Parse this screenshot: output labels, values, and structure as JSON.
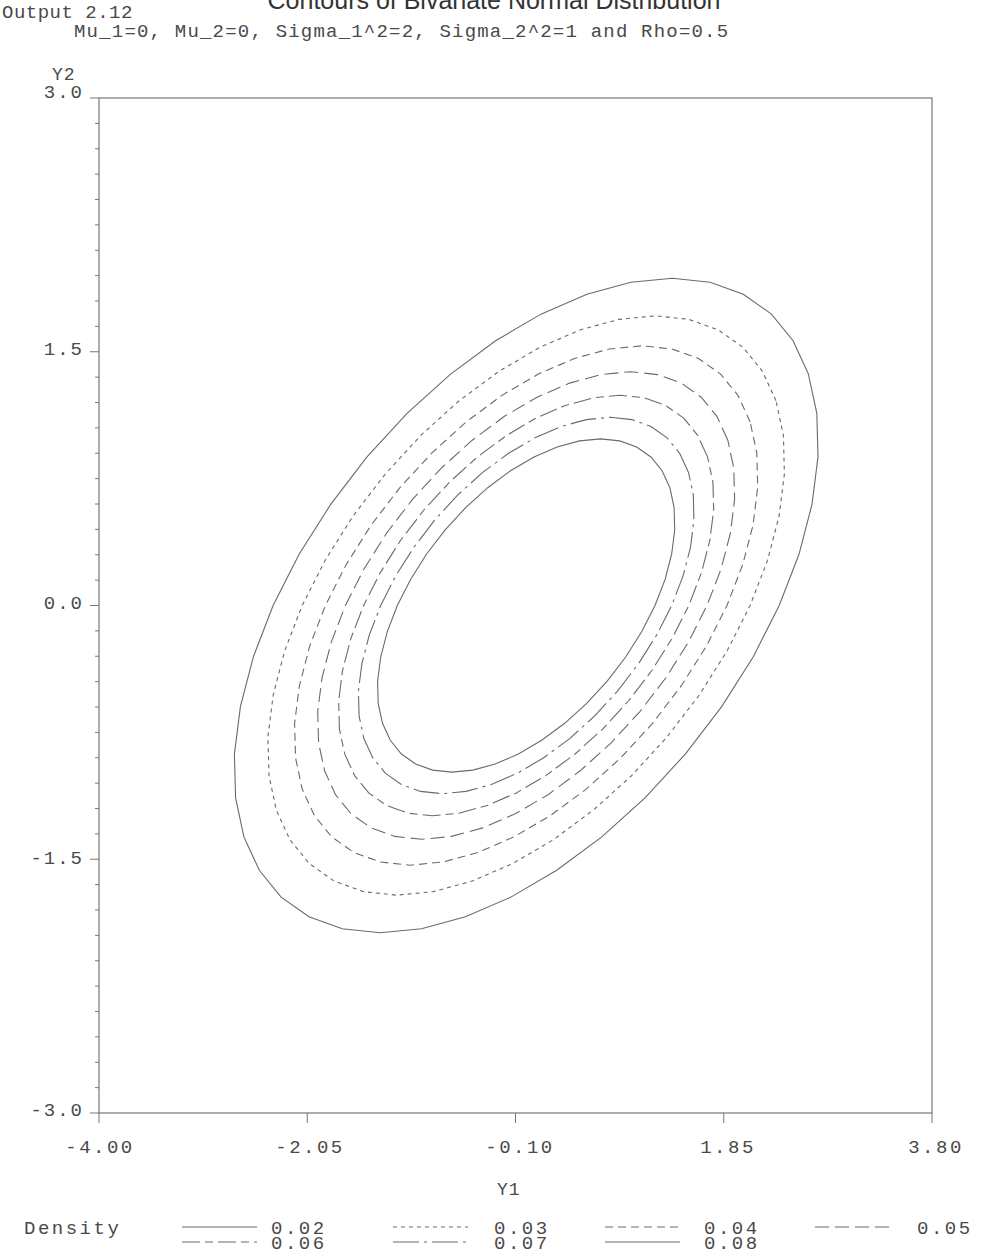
{
  "header": {
    "title": "Contours of Bivariate Normal Distribution",
    "output_label": "Output 2.12",
    "subtitle": "Mu_1=0, Mu_2=0, Sigma_1^2=2, Sigma_2^2=1 and Rho=0.5"
  },
  "axes": {
    "y_label": "Y2",
    "x_label": "Y1",
    "y_ticks": [
      "3.0",
      "1.5",
      "0.0",
      "-1.5",
      "-3.0"
    ],
    "x_ticks": [
      "-4.00",
      "-2.05",
      "-0.10",
      "1.85",
      "3.80"
    ]
  },
  "legend": {
    "title": "Density",
    "entries": [
      {
        "label": "0.02",
        "style": "solid"
      },
      {
        "label": "0.03",
        "style": "dotted"
      },
      {
        "label": "0.04",
        "style": "short-dash"
      },
      {
        "label": "0.05",
        "style": "long-dash"
      },
      {
        "label": "0.06",
        "style": "dash-long-short"
      },
      {
        "label": "0.07",
        "style": "long-dash-dot"
      },
      {
        "label": "0.08",
        "style": "solid"
      }
    ]
  },
  "colors": {
    "line": "#6a6a6a",
    "axis": "#777777",
    "text": "#4a4a4a"
  },
  "chart_data": {
    "type": "contour",
    "title": "Contours of Bivariate Normal Distribution",
    "subtitle": "Mu_1=0, Mu_2=0, Sigma_1^2=2, Sigma_2^2=1 and Rho=0.5",
    "xlabel": "Y1",
    "ylabel": "Y2",
    "xlim": [
      -4.0,
      3.8
    ],
    "ylim": [
      -3.0,
      3.0
    ],
    "x_ticks": [
      -4.0,
      -2.05,
      -0.1,
      1.85,
      3.8
    ],
    "y_ticks": [
      -3.0,
      -1.5,
      0.0,
      1.5,
      3.0
    ],
    "y_minor_step": 0.15,
    "grid": false,
    "legend_position": "bottom",
    "legend_title": "Density",
    "parameters": {
      "mu1": 0,
      "mu2": 0,
      "sigma1_sq": 2,
      "sigma2_sq": 1,
      "rho": 0.5
    },
    "levels": [
      0.02,
      0.03,
      0.04,
      0.05,
      0.06,
      0.07,
      0.08
    ],
    "level_styles": [
      "solid",
      "dotted",
      "short-dash",
      "long-dash",
      "dash-long-short",
      "long-dash-dot",
      "solid"
    ]
  }
}
